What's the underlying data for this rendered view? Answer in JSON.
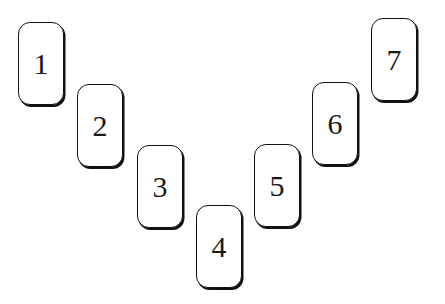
{
  "cards": [
    {
      "label": "1",
      "x": 18,
      "y": 22
    },
    {
      "label": "2",
      "x": 77,
      "y": 84
    },
    {
      "label": "3",
      "x": 137,
      "y": 145
    },
    {
      "label": "4",
      "x": 196,
      "y": 205
    },
    {
      "label": "5",
      "x": 254,
      "y": 144
    },
    {
      "label": "6",
      "x": 312,
      "y": 82
    },
    {
      "label": "7",
      "x": 371,
      "y": 18
    }
  ]
}
